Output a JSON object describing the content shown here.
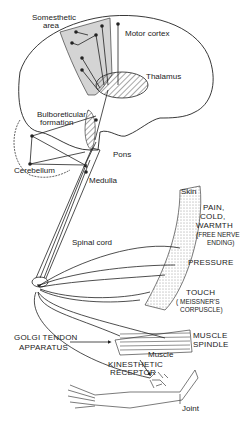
{
  "diagram": {
    "colors": {
      "line": "#222222",
      "cortex_fill": "#d4d4d4",
      "background": "#ffffff"
    },
    "brain_labels": {
      "somesthetic_area": "Somesthetic",
      "somesthetic_area_2": "area",
      "motor_cortex": "Motor cortex",
      "thalamus": "Thalamus",
      "bulboreticular": "Bulboreticular",
      "bulboreticular_2": "formation",
      "cerebellum": "Cerebellum",
      "pons": "Pons",
      "medulla": "Medulla",
      "spinal_cord": "Spinal cord"
    },
    "receptor_labels": {
      "skin": "Skin",
      "pain_1": "PAIN,",
      "pain_2": "COLD,",
      "pain_3": "WARMTH",
      "pain_4": "(FREE NERVE",
      "pain_5": "ENDING)",
      "pressure": "PRESSURE",
      "touch": "TOUCH",
      "touch_2": "( MEISSNER'S",
      "touch_3": "CORPUSCLE)",
      "muscle_spindle_1": "MUSCLE",
      "muscle_spindle_2": "SPINDLE",
      "golgi_1": "GOLGI  TENDON",
      "golgi_2": "APPARATUS",
      "muscle": "Muscle",
      "kinesthetic_1": "KINESTHETIC",
      "kinesthetic_2": "RECEPTOR",
      "joint": "Joint"
    }
  }
}
